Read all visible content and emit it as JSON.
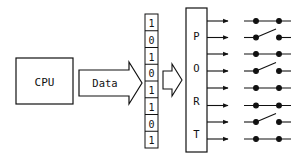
{
  "cpu": {
    "label": "CPU"
  },
  "bus_arrow": {
    "label": "Data"
  },
  "register": {
    "bits": [
      "1",
      "0",
      "1",
      "0",
      "1",
      "1",
      "0",
      "1"
    ]
  },
  "port": {
    "letters": [
      "P",
      "O",
      "R",
      "T"
    ]
  },
  "switches": {
    "states": [
      "closed",
      "open",
      "closed",
      "open",
      "closed",
      "closed",
      "open",
      "closed"
    ]
  },
  "colors": {
    "line": "#111111",
    "background": "#ffffff"
  }
}
